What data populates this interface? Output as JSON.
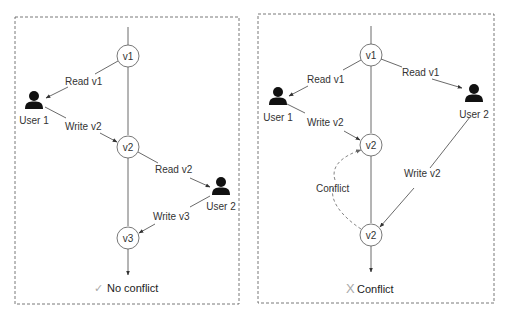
{
  "panels": [
    {
      "id": "no-conflict",
      "nodes": {
        "v1": "v1",
        "v2": "v2",
        "v3": "v3"
      },
      "users": {
        "user1": "User 1",
        "user2": "User 2"
      },
      "edges": {
        "read_v1": "Read v1",
        "write_v2": "Write v2",
        "read_v2": "Read v2",
        "write_v3": "Write v3"
      },
      "footer": {
        "icon": "check-icon",
        "glyph": "✓",
        "text": "No conflict",
        "icon_color": "#aaaaaa"
      }
    },
    {
      "id": "conflict",
      "nodes": {
        "v1": "v1",
        "v2a": "v2",
        "v2b": "v2"
      },
      "users": {
        "user1": "User 1",
        "user2": "User 2"
      },
      "edges": {
        "read_v1_user1": "Read v1",
        "read_v1_user2": "Read v1",
        "write_v2_user1": "Write v2",
        "write_v2_user2": "Write v2",
        "conflict": "Conflict"
      },
      "footer": {
        "icon": "x-icon",
        "glyph": "X",
        "text": "Conflict",
        "icon_color": "#aaaaaa"
      }
    }
  ]
}
